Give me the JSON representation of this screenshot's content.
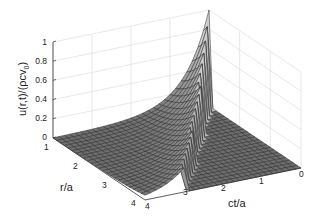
{
  "chart_data": {
    "type": "surface3d",
    "title": "",
    "xlabel": "ct/a",
    "ylabel": "r/a",
    "zlabel": "u(r,t)/(ρcv₀)",
    "zlabel_parts": {
      "main": "u(r,t)/(ρcv",
      "sub": "0",
      "close": ")"
    },
    "xlim": [
      0,
      4
    ],
    "ylim": [
      1,
      4
    ],
    "zlim": [
      0,
      1
    ],
    "x_ticks": [
      "0",
      "1",
      "2",
      "3",
      "4"
    ],
    "y_ticks": [
      "1",
      "2",
      "3",
      "4"
    ],
    "z_ticks": [
      "0",
      "0.2",
      "0.4",
      "0.6",
      "0.8",
      "1"
    ],
    "grid": true,
    "wavefront_peaks": [
      {
        "r": 1.0,
        "ct": 0.0,
        "u": 1.0
      },
      {
        "r": 1.5,
        "ct": 0.5,
        "u": 0.67
      },
      {
        "r": 2.0,
        "ct": 1.0,
        "u": 0.5
      },
      {
        "r": 2.5,
        "ct": 1.5,
        "u": 0.4
      },
      {
        "r": 3.0,
        "ct": 2.0,
        "u": 0.33
      },
      {
        "r": 3.5,
        "ct": 2.5,
        "u": 0.29
      },
      {
        "r": 4.0,
        "ct": 3.0,
        "u": 0.25
      }
    ],
    "surface_color": "#6e6e6e",
    "edge_color": "#2a2a2a",
    "grid_color": "#d8d8d8"
  }
}
